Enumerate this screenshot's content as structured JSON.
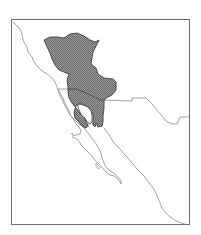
{
  "map": {
    "type": "species-range-map",
    "region": "Northwestern Mexico and southwestern United States",
    "colors": {
      "background": "#ffffff",
      "frame": "#6e6e6e",
      "coastline": "#8c8c8c",
      "border": "#8c8c8c",
      "range_fill": "#8f8f8f",
      "range_hatch": "#6a6a6a",
      "range_outline": "#3f3f3f"
    },
    "layers": [
      {
        "name": "frame",
        "label": ""
      },
      {
        "name": "pacific-coastline",
        "label": ""
      },
      {
        "name": "gulf-coastline",
        "label": ""
      },
      {
        "name": "international-border",
        "label": ""
      },
      {
        "name": "distribution-range",
        "label": ""
      }
    ]
  }
}
